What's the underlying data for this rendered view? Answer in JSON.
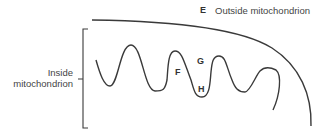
{
  "diagram": {
    "outside_label": {
      "letter": "E",
      "text": "Outside mitochondrion"
    },
    "inside_label": {
      "line1": "Inside",
      "line2": "mitochondrion"
    },
    "markers": {
      "F": "F",
      "G": "G",
      "H": "H"
    },
    "colors": {
      "stroke": "#3a3a3a",
      "text": "#444444",
      "background": "#ffffff"
    }
  }
}
